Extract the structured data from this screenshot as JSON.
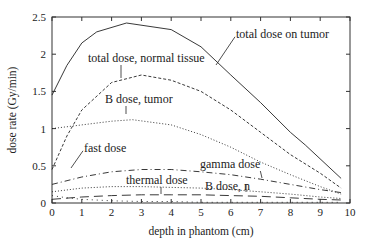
{
  "chart_data": {
    "type": "line",
    "title": "",
    "xlabel": "depth in phantom (cm)",
    "ylabel": "dose rate (Gy/min)",
    "xlim": [
      0,
      10
    ],
    "ylim": [
      0,
      2.5
    ],
    "xticks": [
      "0",
      "1",
      "2",
      "3",
      "4",
      "5",
      "6",
      "7",
      "8",
      "9",
      "10"
    ],
    "yticks": [
      "0",
      "0.5",
      "1",
      "1.5",
      "2",
      "2.5"
    ],
    "grid": false,
    "legend": "inline annotations with leader lines",
    "series": [
      {
        "name": "total dose on tumor",
        "style": "solid",
        "x": [
          0,
          0.5,
          1,
          1.5,
          2.5,
          4,
          5,
          6,
          7,
          8,
          8.5,
          9.7
        ],
        "y": [
          1.45,
          1.85,
          2.15,
          2.3,
          2.42,
          2.33,
          2.1,
          1.72,
          1.35,
          0.95,
          0.78,
          0.33
        ]
      },
      {
        "name": "total dose, normal tissue",
        "style": "short-dash",
        "x": [
          0,
          0.5,
          1,
          2,
          3,
          4,
          5,
          6,
          7,
          8,
          9,
          9.7
        ],
        "y": [
          0.45,
          0.9,
          1.25,
          1.62,
          1.72,
          1.65,
          1.5,
          1.25,
          0.95,
          0.65,
          0.4,
          0.2
        ]
      },
      {
        "name": "B dose, tumor",
        "style": "dotted",
        "x": [
          0,
          1,
          2,
          2.7,
          4,
          5,
          6,
          7,
          8,
          9,
          9.7
        ],
        "y": [
          1.0,
          1.05,
          1.1,
          1.12,
          1.05,
          0.92,
          0.75,
          0.55,
          0.38,
          0.22,
          0.12
        ]
      },
      {
        "name": "gamma dose",
        "style": "dash-dot",
        "x": [
          0,
          1,
          2,
          3,
          4,
          5,
          6,
          7,
          8,
          9,
          9.7
        ],
        "y": [
          0.25,
          0.35,
          0.42,
          0.45,
          0.45,
          0.42,
          0.38,
          0.32,
          0.25,
          0.18,
          0.14
        ]
      },
      {
        "name": "B dose, n",
        "style": "dotted",
        "x": [
          0,
          1,
          2,
          3,
          4,
          5,
          6,
          7,
          8,
          9,
          9.7
        ],
        "y": [
          0.15,
          0.2,
          0.22,
          0.22,
          0.21,
          0.2,
          0.18,
          0.15,
          0.12,
          0.08,
          0.06
        ]
      },
      {
        "name": "thermal dose",
        "style": "long-dash",
        "x": [
          0,
          1,
          2,
          3,
          4,
          5,
          6,
          7,
          8,
          9,
          9.7
        ],
        "y": [
          0.05,
          0.08,
          0.1,
          0.11,
          0.11,
          0.11,
          0.1,
          0.09,
          0.07,
          0.05,
          0.04
        ]
      },
      {
        "name": "fast dose",
        "style": "sparse-dot",
        "x": [
          0,
          0.5,
          1,
          2,
          3,
          4,
          5,
          6,
          7,
          8,
          9,
          9.7
        ],
        "y": [
          0.1,
          0.07,
          0.05,
          0.03,
          0.02,
          0.02,
          0.01,
          0.01,
          0.01,
          0.01,
          0.01,
          0.01
        ]
      }
    ],
    "annotations": [
      {
        "text": "total dose on tumor",
        "x_px": 236,
        "y_px": 38,
        "pointer_to_px": [
          216,
          65
        ]
      },
      {
        "text": "total dose, normal tissue",
        "x_px": 88,
        "y_px": 62,
        "pointer_to_px": [
          121,
          78
        ]
      },
      {
        "text": "B dose, tumor",
        "x_px": 105,
        "y_px": 103,
        "pointer_to_px": [
          126,
          114
        ]
      },
      {
        "text": "fast dose",
        "x_px": 84,
        "y_px": 152,
        "pointer_to_px": [
          71,
          168
        ]
      },
      {
        "text": "gamma dose",
        "x_px": 200,
        "y_px": 168,
        "pointer_to_px": [
          262,
          178
        ]
      },
      {
        "text": "thermal dose",
        "x_px": 126,
        "y_px": 184,
        "pointer_to_px": [
          161,
          194
        ]
      },
      {
        "text": "B dose, n",
        "x_px": 205,
        "y_px": 190,
        "pointer_to_px": [
          246,
          184
        ]
      }
    ]
  },
  "colors": {
    "line": "#222222",
    "background": "#ffffff"
  }
}
